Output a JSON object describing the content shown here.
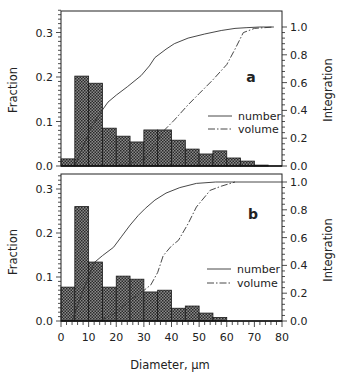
{
  "chart_data": [
    {
      "type": "bar",
      "panel_label": "a",
      "title": "",
      "xlabel": "Diameter, µm",
      "ylabel": "Fraction",
      "y2label": "Integration",
      "xlim": [
        0,
        80
      ],
      "ylim": [
        0,
        0.35
      ],
      "y2lim": [
        0,
        1.0
      ],
      "xticks": [
        0,
        10,
        20,
        30,
        40,
        50,
        60,
        70,
        80
      ],
      "yticks": [
        "0.0",
        "0.1",
        "0.2",
        "0.3"
      ],
      "y2ticks": [
        "0.0",
        "0.2",
        "0.4",
        "0.6",
        "0.8",
        "1.0"
      ],
      "bin_width": 5,
      "bins_start": [
        0,
        5,
        10,
        15,
        20,
        25,
        30,
        35,
        40,
        45,
        50,
        55,
        60,
        65,
        70
      ],
      "values": [
        0.016,
        0.202,
        0.186,
        0.085,
        0.067,
        0.054,
        0.081,
        0.081,
        0.058,
        0.038,
        0.027,
        0.034,
        0.018,
        0.011,
        0.002
      ],
      "series": [
        {
          "name": "number",
          "style": "solid",
          "axis": "right",
          "x": [
            5,
            8,
            11,
            14.5,
            17,
            20,
            24,
            29,
            32,
            34,
            38,
            41,
            46,
            52,
            58,
            63,
            67,
            72,
            77
          ],
          "y": [
            0.0,
            0.14,
            0.28,
            0.39,
            0.46,
            0.51,
            0.57,
            0.65,
            0.72,
            0.78,
            0.84,
            0.88,
            0.92,
            0.95,
            0.975,
            0.99,
            0.995,
            1.0,
            1.0
          ]
        },
        {
          "name": "volume",
          "style": "dashdot",
          "axis": "right",
          "x": [
            20,
            25,
            30,
            33,
            37,
            41,
            46,
            50,
            55,
            60,
            63,
            66,
            70,
            77
          ],
          "y": [
            0.0,
            0.02,
            0.05,
            0.12,
            0.25,
            0.33,
            0.44,
            0.52,
            0.62,
            0.73,
            0.84,
            0.96,
            0.99,
            1.0
          ]
        }
      ],
      "legend": [
        "number",
        "volume"
      ],
      "legend_position": "center-right",
      "grid": false
    },
    {
      "type": "bar",
      "panel_label": "b",
      "title": "",
      "xlabel": "Diameter, µm",
      "ylabel": "Fraction",
      "y2label": "Integration",
      "xlim": [
        0,
        80
      ],
      "ylim": [
        0,
        0.33
      ],
      "y2lim": [
        0,
        1.0
      ],
      "xticks": [
        0,
        10,
        20,
        30,
        40,
        50,
        60,
        70,
        80
      ],
      "yticks": [
        "0.0",
        "0.1",
        "0.2",
        "0.3"
      ],
      "y2ticks": [
        "0.0",
        "0.2",
        "0.4",
        "0.6",
        "0.8",
        "1.0"
      ],
      "bin_width": 5,
      "bins_start": [
        0,
        5,
        10,
        15,
        20,
        25,
        30,
        35,
        40,
        45,
        50,
        55
      ],
      "values": [
        0.077,
        0.26,
        0.134,
        0.077,
        0.102,
        0.095,
        0.066,
        0.07,
        0.029,
        0.034,
        0.018,
        0.008
      ],
      "series": [
        {
          "name": "number",
          "style": "solid",
          "axis": "right",
          "x": [
            4,
            8,
            12,
            15,
            19,
            22,
            25,
            28,
            30.5,
            34,
            38,
            43,
            49,
            56,
            80
          ],
          "y": [
            0.0,
            0.22,
            0.42,
            0.47,
            0.53,
            0.61,
            0.69,
            0.76,
            0.81,
            0.87,
            0.92,
            0.96,
            0.99,
            1.0,
            1.0
          ]
        },
        {
          "name": "volume",
          "style": "dashdot",
          "axis": "right",
          "x": [
            14,
            20,
            25,
            30,
            32.5,
            35,
            37,
            40,
            42.5,
            46,
            49,
            54,
            58,
            63
          ],
          "y": [
            0.0,
            0.06,
            0.15,
            0.22,
            0.26,
            0.35,
            0.47,
            0.54,
            0.58,
            0.7,
            0.82,
            0.94,
            0.97,
            1.0
          ]
        }
      ],
      "legend": [
        "number",
        "volume"
      ],
      "legend_position": "center-right",
      "grid": false
    }
  ],
  "labels": {
    "xlabel": "Diameter, µm",
    "ylabel_left": "Fraction",
    "ylabel_right": "Integration",
    "panel_a": "a",
    "panel_b": "b",
    "legend_number": "number",
    "legend_volume": "volume"
  }
}
